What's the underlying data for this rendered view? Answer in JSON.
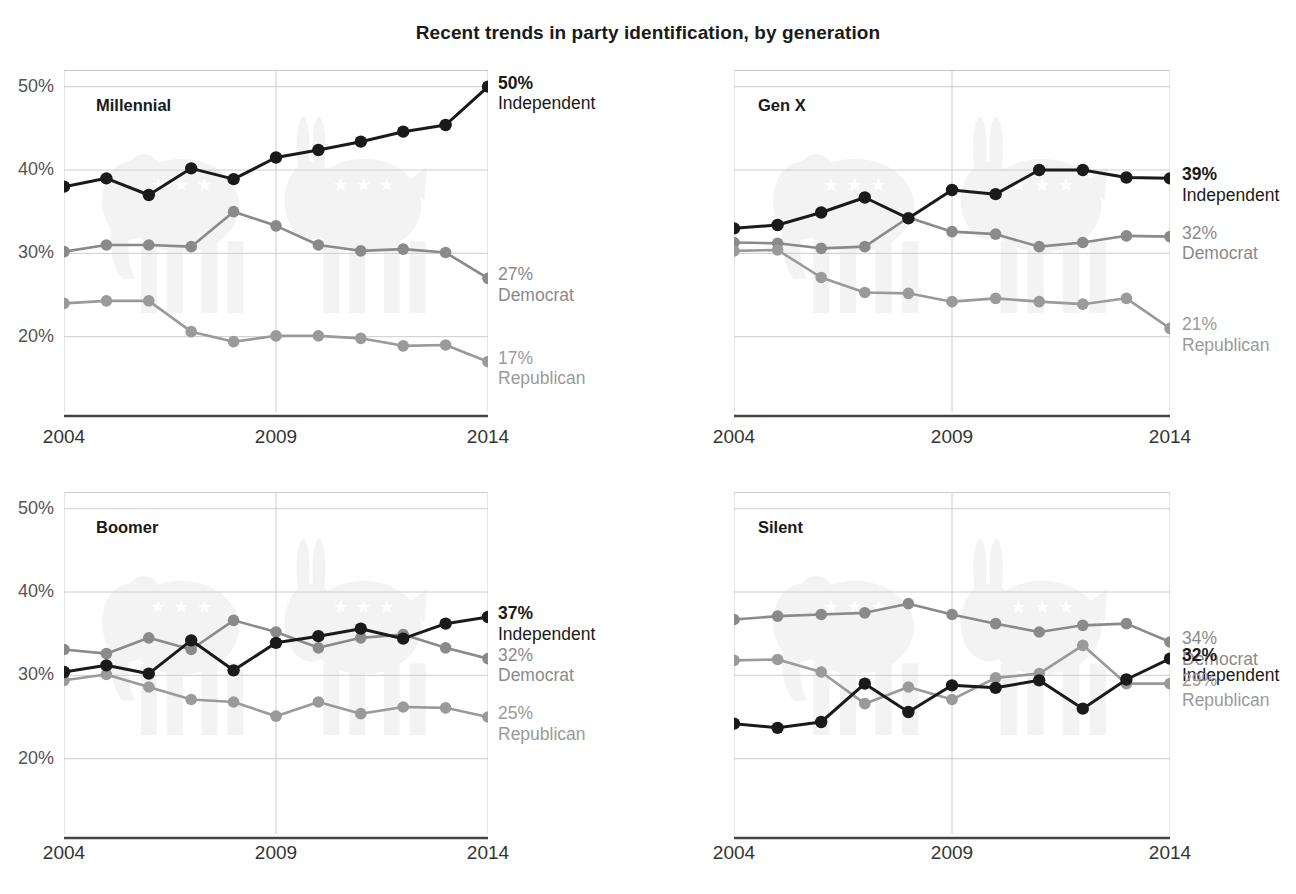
{
  "title": "Recent trends in party identification, by generation",
  "axis": {
    "y_ticks": [
      "50%",
      "40%",
      "30%",
      "20%"
    ],
    "y_values": [
      50,
      40,
      30,
      20
    ],
    "x_ticks": [
      "2004",
      "2009",
      "2014"
    ],
    "x_values": [
      2004,
      2009,
      2014
    ],
    "ylim": [
      16,
      52
    ],
    "xlim": [
      2004,
      2014
    ]
  },
  "colors": {
    "independent": "#1a1a1a",
    "democrat": "#8a8a8a",
    "republican": "#9a9a9a",
    "gridline": "#cccccc",
    "axisline": "#444444",
    "watermark": "#f0f0f0",
    "background": "#ffffff"
  },
  "panels": [
    {
      "name": "Millennial",
      "legend": [
        {
          "pct": "50%",
          "party": "Independent",
          "klass": "legend-ind"
        },
        {
          "pct": "27%",
          "party": "Democrat",
          "klass": "legend-dem"
        },
        {
          "pct": "17%",
          "party": "Republican",
          "klass": "legend-rep"
        }
      ]
    },
    {
      "name": "Gen X",
      "legend": [
        {
          "pct": "39%",
          "party": "Independent",
          "klass": "legend-ind"
        },
        {
          "pct": "32%",
          "party": "Democrat",
          "klass": "legend-dem"
        },
        {
          "pct": "21%",
          "party": "Republican",
          "klass": "legend-rep"
        }
      ]
    },
    {
      "name": "Boomer",
      "legend": [
        {
          "pct": "37%",
          "party": "Independent",
          "klass": "legend-ind"
        },
        {
          "pct": "32%",
          "party": "Democrat",
          "klass": "legend-dem"
        },
        {
          "pct": "25%",
          "party": "Republican",
          "klass": "legend-rep"
        }
      ]
    },
    {
      "name": "Silent",
      "legend": [
        {
          "pct": "34%",
          "party": "Democrat",
          "klass": "legend-dem"
        },
        {
          "pct": "32%",
          "party": "Independent",
          "klass": "legend-ind"
        },
        {
          "pct": "29%",
          "party": "Republican",
          "klass": "legend-rep"
        }
      ]
    }
  ],
  "chart_data": {
    "type": "line",
    "title": "Recent trends in party identification, by generation",
    "xlabel": "",
    "ylabel": "",
    "xlim": [
      2004,
      2014
    ],
    "ylim": [
      16,
      52
    ],
    "grid": true,
    "legend_position": "right-of-panel",
    "x": [
      2004,
      2004.83,
      2005.67,
      2006.5,
      2007.33,
      2008.17,
      2009,
      2009.83,
      2010.67,
      2011.5,
      2012.33,
      2013.17,
      2014
    ],
    "x_tick_labels": [
      "2004",
      "2009",
      "2014"
    ],
    "y_tick_labels": [
      "50%",
      "40%",
      "30%",
      "20%"
    ],
    "panels": [
      {
        "panel": "Millennial",
        "series": [
          {
            "name": "Independent",
            "color": "#1a1a1a",
            "values": [
              38,
              39,
              37,
              40.2,
              38.9,
              41.5,
              42.4,
              43.4,
              44.6,
              45.4,
              50,
              0,
              0
            ],
            "values_full": [
              38,
              39,
              37,
              40.2,
              38.9,
              41.5,
              42.4,
              43.4,
              44.6,
              45.4,
              50
            ]
          },
          {
            "name": "Democrat",
            "color": "#8a8a8a",
            "values_full": [
              30.2,
              31,
              31,
              30.8,
              35,
              33.3,
              31,
              30.3,
              30.5,
              30.1,
              27
            ]
          },
          {
            "name": "Republican",
            "color": "#9a9a9a",
            "values_full": [
              24,
              24.3,
              24.3,
              20.6,
              19.4,
              20.1,
              20.1,
              19.8,
              18.9,
              19,
              17
            ]
          }
        ],
        "endpoint_labels": [
          {
            "series": "Independent",
            "value": 50,
            "label": "50%"
          },
          {
            "series": "Democrat",
            "value": 27,
            "label": "27%"
          },
          {
            "series": "Republican",
            "value": 17,
            "label": "17%"
          }
        ]
      },
      {
        "panel": "Gen X",
        "series": [
          {
            "name": "Independent",
            "color": "#1a1a1a",
            "values_full": [
              33,
              33.4,
              34.9,
              36.7,
              34.2,
              37.6,
              37.1,
              40,
              40,
              39.1,
              39
            ]
          },
          {
            "name": "Democrat",
            "color": "#8a8a8a",
            "values_full": [
              31.3,
              31.2,
              30.6,
              30.8,
              34.3,
              32.6,
              32.3,
              30.8,
              31.3,
              32.1,
              32
            ]
          },
          {
            "name": "Republican",
            "color": "#9a9a9a",
            "values_full": [
              30.3,
              30.4,
              27.1,
              25.3,
              25.2,
              24.2,
              24.6,
              24.2,
              23.9,
              24.6,
              21
            ]
          }
        ],
        "endpoint_labels": [
          {
            "series": "Independent",
            "value": 39,
            "label": "39%"
          },
          {
            "series": "Democrat",
            "value": 32,
            "label": "32%"
          },
          {
            "series": "Republican",
            "value": 21,
            "label": "21%"
          }
        ]
      },
      {
        "panel": "Boomer",
        "series": [
          {
            "name": "Independent",
            "color": "#1a1a1a",
            "values_full": [
              30.4,
              31.2,
              30.2,
              34.2,
              30.6,
              33.9,
              34.7,
              35.6,
              34.4,
              36.2,
              37
            ]
          },
          {
            "name": "Democrat",
            "color": "#8a8a8a",
            "values_full": [
              33.1,
              32.6,
              34.5,
              33.1,
              36.6,
              35.2,
              33.3,
              34.5,
              34.9,
              33.3,
              32
            ]
          },
          {
            "name": "Republican",
            "color": "#9a9a9a",
            "values_full": [
              29.4,
              30.1,
              28.6,
              27.1,
              26.8,
              25.1,
              26.8,
              25.4,
              26.2,
              26.1,
              25
            ]
          }
        ],
        "endpoint_labels": [
          {
            "series": "Independent",
            "value": 37,
            "label": "37%"
          },
          {
            "series": "Democrat",
            "value": 32,
            "label": "32%"
          },
          {
            "series": "Republican",
            "value": 25,
            "label": "25%"
          }
        ]
      },
      {
        "panel": "Silent",
        "series": [
          {
            "name": "Democrat",
            "color": "#8a8a8a",
            "values_full": [
              36.7,
              37.1,
              37.3,
              37.5,
              38.6,
              37.3,
              36.2,
              35.2,
              36,
              36.2,
              34
            ]
          },
          {
            "name": "Independent",
            "color": "#1a1a1a",
            "values_full": [
              24.2,
              23.7,
              24.4,
              29,
              25.6,
              28.8,
              28.5,
              29.4,
              26,
              29.5,
              32
            ]
          },
          {
            "name": "Republican",
            "color": "#9a9a9a",
            "values_full": [
              31.8,
              31.9,
              30.4,
              26.6,
              28.6,
              27.1,
              29.7,
              30.2,
              33.6,
              29,
              29
            ]
          }
        ],
        "endpoint_labels": [
          {
            "series": "Democrat",
            "value": 34,
            "label": "34%"
          },
          {
            "series": "Independent",
            "value": 32,
            "label": "32%"
          },
          {
            "series": "Republican",
            "value": 29,
            "label": "29%"
          }
        ]
      }
    ]
  }
}
